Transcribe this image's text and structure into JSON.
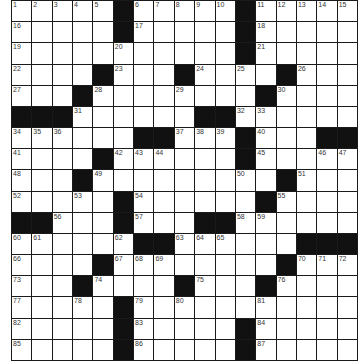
{
  "puzzle": {
    "rows": 17,
    "cols": 17,
    "colors": {
      "black": "#111111",
      "white": "#ffffff",
      "grid_line": "#1a1a1a",
      "number": "#333333"
    },
    "black_cells": [
      [
        0,
        5
      ],
      [
        0,
        11
      ],
      [
        1,
        5
      ],
      [
        1,
        11
      ],
      [
        2,
        11
      ],
      [
        3,
        4
      ],
      [
        3,
        8
      ],
      [
        3,
        13
      ],
      [
        4,
        3
      ],
      [
        4,
        12
      ],
      [
        5,
        0
      ],
      [
        5,
        1
      ],
      [
        5,
        2
      ],
      [
        5,
        9
      ],
      [
        5,
        10
      ],
      [
        6,
        6
      ],
      [
        6,
        7
      ],
      [
        6,
        11
      ],
      [
        6,
        15
      ],
      [
        6,
        16
      ],
      [
        7,
        4
      ],
      [
        7,
        11
      ],
      [
        8,
        3
      ],
      [
        8,
        13
      ],
      [
        9,
        5
      ],
      [
        9,
        12
      ],
      [
        10,
        0
      ],
      [
        10,
        1
      ],
      [
        10,
        5
      ],
      [
        10,
        9
      ],
      [
        10,
        10
      ],
      [
        11,
        6
      ],
      [
        11,
        7
      ],
      [
        11,
        14
      ],
      [
        11,
        15
      ],
      [
        11,
        16
      ],
      [
        12,
        4
      ],
      [
        12,
        13
      ],
      [
        13,
        3
      ],
      [
        13,
        8
      ],
      [
        13,
        12
      ],
      [
        14,
        5
      ],
      [
        15,
        5
      ],
      [
        15,
        11
      ],
      [
        16,
        5
      ],
      [
        16,
        11
      ]
    ],
    "numbers": [
      {
        "r": 0,
        "c": 0,
        "n": "1"
      },
      {
        "r": 0,
        "c": 1,
        "n": "2"
      },
      {
        "r": 0,
        "c": 2,
        "n": "3"
      },
      {
        "r": 0,
        "c": 3,
        "n": "4"
      },
      {
        "r": 0,
        "c": 4,
        "n": "5"
      },
      {
        "r": 0,
        "c": 6,
        "n": "6"
      },
      {
        "r": 0,
        "c": 7,
        "n": "7"
      },
      {
        "r": 0,
        "c": 8,
        "n": "8"
      },
      {
        "r": 0,
        "c": 9,
        "n": "9"
      },
      {
        "r": 0,
        "c": 10,
        "n": "10"
      },
      {
        "r": 0,
        "c": 12,
        "n": "11"
      },
      {
        "r": 0,
        "c": 13,
        "n": "12"
      },
      {
        "r": 0,
        "c": 14,
        "n": "13"
      },
      {
        "r": 0,
        "c": 15,
        "n": "14"
      },
      {
        "r": 0,
        "c": 16,
        "n": "15"
      },
      {
        "r": 1,
        "c": 0,
        "n": "16"
      },
      {
        "r": 1,
        "c": 6,
        "n": "17"
      },
      {
        "r": 1,
        "c": 12,
        "n": "18"
      },
      {
        "r": 2,
        "c": 0,
        "n": "19"
      },
      {
        "r": 2,
        "c": 5,
        "n": "20"
      },
      {
        "r": 2,
        "c": 12,
        "n": "21"
      },
      {
        "r": 3,
        "c": 0,
        "n": "22"
      },
      {
        "r": 3,
        "c": 5,
        "n": "23"
      },
      {
        "r": 3,
        "c": 9,
        "n": "24"
      },
      {
        "r": 3,
        "c": 11,
        "n": "25"
      },
      {
        "r": 3,
        "c": 14,
        "n": "26"
      },
      {
        "r": 4,
        "c": 0,
        "n": "27"
      },
      {
        "r": 4,
        "c": 4,
        "n": "28"
      },
      {
        "r": 4,
        "c": 8,
        "n": "29"
      },
      {
        "r": 4,
        "c": 13,
        "n": "30"
      },
      {
        "r": 5,
        "c": 3,
        "n": "31"
      },
      {
        "r": 5,
        "c": 11,
        "n": "32"
      },
      {
        "r": 5,
        "c": 12,
        "n": "33"
      },
      {
        "r": 6,
        "c": 0,
        "n": "34"
      },
      {
        "r": 6,
        "c": 1,
        "n": "35"
      },
      {
        "r": 6,
        "c": 2,
        "n": "36"
      },
      {
        "r": 6,
        "c": 8,
        "n": "37"
      },
      {
        "r": 6,
        "c": 9,
        "n": "38"
      },
      {
        "r": 6,
        "c": 10,
        "n": "39"
      },
      {
        "r": 6,
        "c": 12,
        "n": "40"
      },
      {
        "r": 7,
        "c": 0,
        "n": "41"
      },
      {
        "r": 7,
        "c": 5,
        "n": "42"
      },
      {
        "r": 7,
        "c": 6,
        "n": "43"
      },
      {
        "r": 7,
        "c": 7,
        "n": "44"
      },
      {
        "r": 7,
        "c": 12,
        "n": "45"
      },
      {
        "r": 7,
        "c": 15,
        "n": "46"
      },
      {
        "r": 7,
        "c": 16,
        "n": "47"
      },
      {
        "r": 8,
        "c": 0,
        "n": "48"
      },
      {
        "r": 8,
        "c": 4,
        "n": "49"
      },
      {
        "r": 8,
        "c": 11,
        "n": "50"
      },
      {
        "r": 8,
        "c": 14,
        "n": "51"
      },
      {
        "r": 9,
        "c": 0,
        "n": "52"
      },
      {
        "r": 9,
        "c": 3,
        "n": "53"
      },
      {
        "r": 9,
        "c": 6,
        "n": "54"
      },
      {
        "r": 9,
        "c": 13,
        "n": "55"
      },
      {
        "r": 10,
        "c": 2,
        "n": "56"
      },
      {
        "r": 10,
        "c": 6,
        "n": "57"
      },
      {
        "r": 10,
        "c": 11,
        "n": "58"
      },
      {
        "r": 10,
        "c": 12,
        "n": "59"
      },
      {
        "r": 11,
        "c": 0,
        "n": "60"
      },
      {
        "r": 11,
        "c": 1,
        "n": "61"
      },
      {
        "r": 11,
        "c": 5,
        "n": "62"
      },
      {
        "r": 11,
        "c": 8,
        "n": "63"
      },
      {
        "r": 11,
        "c": 9,
        "n": "64"
      },
      {
        "r": 11,
        "c": 10,
        "n": "65"
      },
      {
        "r": 12,
        "c": 0,
        "n": "66"
      },
      {
        "r": 12,
        "c": 5,
        "n": "67"
      },
      {
        "r": 12,
        "c": 6,
        "n": "68"
      },
      {
        "r": 12,
        "c": 7,
        "n": "69"
      },
      {
        "r": 12,
        "c": 14,
        "n": "70"
      },
      {
        "r": 12,
        "c": 15,
        "n": "71"
      },
      {
        "r": 12,
        "c": 16,
        "n": "72"
      },
      {
        "r": 13,
        "c": 0,
        "n": "73"
      },
      {
        "r": 13,
        "c": 4,
        "n": "74"
      },
      {
        "r": 13,
        "c": 9,
        "n": "75"
      },
      {
        "r": 13,
        "c": 13,
        "n": "76"
      },
      {
        "r": 14,
        "c": 0,
        "n": "77"
      },
      {
        "r": 14,
        "c": 3,
        "n": "78"
      },
      {
        "r": 14,
        "c": 6,
        "n": "79"
      },
      {
        "r": 14,
        "c": 8,
        "n": "80"
      },
      {
        "r": 14,
        "c": 12,
        "n": "81"
      },
      {
        "r": 15,
        "c": 0,
        "n": "82"
      },
      {
        "r": 15,
        "c": 6,
        "n": "83"
      },
      {
        "r": 15,
        "c": 12,
        "n": "84"
      },
      {
        "r": 16,
        "c": 0,
        "n": "85"
      },
      {
        "r": 16,
        "c": 6,
        "n": "86"
      },
      {
        "r": 16,
        "c": 12,
        "n": "87"
      }
    ]
  }
}
